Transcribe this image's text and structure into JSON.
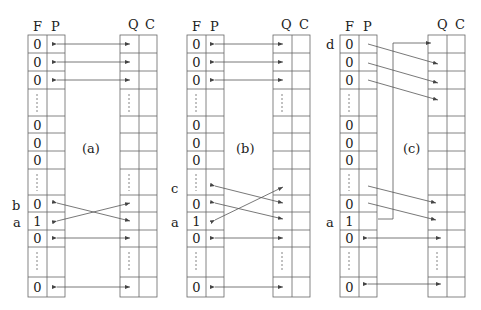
{
  "diagrams": [
    {
      "id": "a",
      "panel_label": "(a)",
      "headers": {
        "f": "F",
        "p": "P",
        "q": "Q",
        "c": "C"
      },
      "f_values": [
        "0",
        "0",
        "0",
        "",
        "0",
        "0",
        "0",
        "",
        "0",
        "1",
        "0",
        "",
        "0"
      ],
      "side_labels": [
        {
          "row": 8,
          "text": "b"
        },
        {
          "row": 9,
          "text": "a"
        }
      ],
      "arrows": "rows 0,1,2,10,12 bidirectional straight; rows 8 and 9 crossed"
    },
    {
      "id": "b",
      "panel_label": "(b)",
      "headers": {
        "f": "F",
        "p": "P",
        "q": "Q",
        "c": "C"
      },
      "f_values": [
        "0",
        "0",
        "0",
        "",
        "0",
        "0",
        "0",
        "",
        "0",
        "1",
        "0",
        "",
        "0"
      ],
      "side_labels": [
        {
          "row": 7,
          "text": "c"
        },
        {
          "row": 9,
          "text": "a"
        }
      ],
      "arrows": "rows 0,1,2,10,12 bidirectional straight; row 7 and row 8 shifted to Q, row 9 crossed up"
    },
    {
      "id": "c",
      "panel_label": "(c)",
      "headers": {
        "f": "F",
        "p": "P",
        "q": "Q",
        "c": "C"
      },
      "f_values": [
        "0",
        "0",
        "0",
        "",
        "0",
        "0",
        "0",
        "",
        "0",
        "1",
        "0",
        "",
        "0"
      ],
      "side_labels": [
        {
          "row": 0,
          "text": "d"
        },
        {
          "row": 9,
          "text": "a"
        }
      ],
      "arrows": "rows 0-2 shifted down by one; rows 7-8 shifted down; row 9 connects up to Q row 0; rows 10,12 straight"
    }
  ],
  "colors": {
    "line": "#555555",
    "text": "#222222",
    "background": "#ffffff"
  }
}
